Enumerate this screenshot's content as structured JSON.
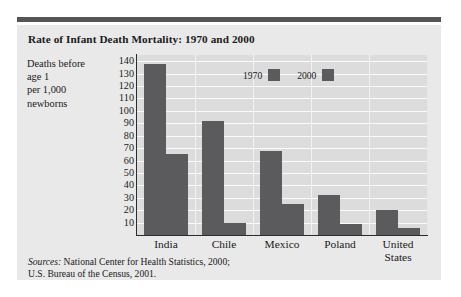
{
  "title": "Rate of Infant Death Mortality: 1970 and 2000",
  "axis_caption_lines": [
    "Deaths before",
    "age 1",
    "per 1,000",
    "newborns"
  ],
  "legend": [
    {
      "label": "1970",
      "color": "#5b5b5e"
    },
    {
      "label": "2000",
      "color": "#5b5b5e"
    }
  ],
  "sources": {
    "prefix": "Sources:",
    "line1": " National Center for Health Statistics, 2000;",
    "line2": "U.S. Bureau of the Census, 2001."
  },
  "colors": {
    "bar": "#5b5b5e",
    "plot_background": "#dcdcdc",
    "gridline": "#fbfbfb",
    "panel_background": "#e9e9e9",
    "rule": "#555558",
    "text": "#1a1a1a"
  },
  "chart_data": {
    "type": "bar",
    "title": "Rate of Infant Death Mortality: 1970 and 2000",
    "xlabel": "",
    "ylabel": "Deaths before age 1 per 1,000 newborns",
    "categories": [
      "India",
      "Chile",
      "Mexico",
      "Poland",
      "United States"
    ],
    "category_lines": [
      [
        "India"
      ],
      [
        "Chile"
      ],
      [
        "Mexico"
      ],
      [
        "Poland"
      ],
      [
        "United",
        "States"
      ]
    ],
    "series": [
      {
        "name": "1970",
        "values": [
          138,
          92,
          68,
          32,
          20
        ]
      },
      {
        "name": "2000",
        "values": [
          65,
          10,
          25,
          9,
          6
        ]
      }
    ],
    "ylim": [
      0,
      145
    ],
    "yticks": [
      140,
      130,
      120,
      110,
      100,
      90,
      80,
      70,
      60,
      50,
      40,
      30,
      20,
      10
    ],
    "ytick_labels": [
      "140",
      "130",
      "120",
      "110",
      "100",
      "90",
      "80",
      "70",
      "60",
      "50",
      "40",
      "30",
      "20",
      "10"
    ],
    "grid": "horizontal",
    "legend_position": "inside-top-center"
  }
}
